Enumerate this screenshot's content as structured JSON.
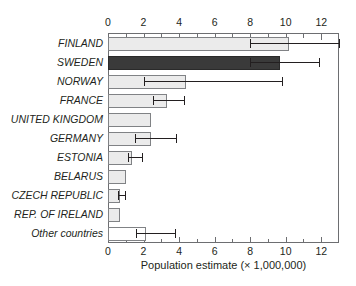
{
  "chart_data": {
    "type": "bar",
    "orientation": "horizontal",
    "title": "",
    "subtitle": "",
    "xlabel": "Population estimate (× 1,000,000)",
    "ylabel": "",
    "xlim": [
      0,
      13
    ],
    "xticks": [
      0,
      2,
      4,
      6,
      8,
      10,
      12
    ],
    "xtick_labels": [
      "0",
      "2",
      "4",
      "6",
      "8",
      "10",
      "12"
    ],
    "minor_tick_step": 1,
    "grid": false,
    "legend": "none",
    "axis_positions": [
      "top",
      "bottom"
    ],
    "categories": [
      "FINLAND",
      "SWEDEN",
      "NORWAY",
      "FRANCE",
      "UNITED KINGDOM",
      "GERMANY",
      "ESTONIA",
      "BELARUS",
      "CZECH REPUBLIC",
      "REP. OF IRELAND",
      "Other countries"
    ],
    "values": [
      10.2,
      9.7,
      4.4,
      3.3,
      2.4,
      2.4,
      1.35,
      1.0,
      0.7,
      0.65,
      2.15
    ],
    "error_low": [
      8.0,
      8.0,
      2.0,
      2.55,
      null,
      1.5,
      1.1,
      null,
      0.55,
      null,
      1.6
    ],
    "error_high": [
      13.0,
      11.9,
      9.8,
      4.3,
      null,
      3.85,
      1.9,
      null,
      0.95,
      null,
      3.75
    ],
    "bar_styles": [
      "light",
      "dark",
      "light",
      "light",
      "light",
      "light",
      "light",
      "light",
      "light",
      "light",
      "white"
    ],
    "colors": {
      "bar_light": "#ebebeb",
      "bar_dark": "#3a3a3a",
      "bar_white": "#ffffff",
      "bar_edge": "#808285",
      "axis": "#6d6e71",
      "text": "#231f20",
      "error_bar": "#231f20"
    }
  }
}
